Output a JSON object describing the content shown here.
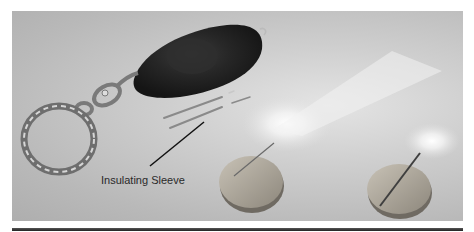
{
  "figure": {
    "labels": [
      {
        "text": "Insulating Sleeve",
        "target": "insulating-sleeve"
      }
    ]
  }
}
